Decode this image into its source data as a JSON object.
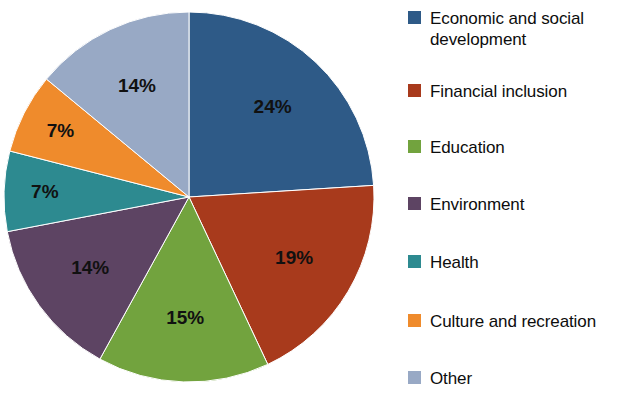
{
  "chart_data": {
    "type": "pie",
    "title": "",
    "subtitle": "",
    "xlabel": "",
    "ylabel": "",
    "legend_position": "right",
    "grid": false,
    "start_angle_deg": 0,
    "direction": "clockwise",
    "categories": [
      "Economic and social development",
      "Financial inclusion",
      "Education",
      "Environment",
      "Health",
      "Culture and recreation",
      "Other"
    ],
    "values": [
      24,
      19,
      15,
      14,
      7,
      7,
      14
    ],
    "data_labels": [
      "24%",
      "19%",
      "15%",
      "14%",
      "7%",
      "7%",
      "14%"
    ],
    "colors": [
      "#2e5a87",
      "#a83a1c",
      "#72a33e",
      "#5d4463",
      "#2d8a90",
      "#ef8b2c",
      "#98a9c5"
    ],
    "slices": [
      {
        "label": "Economic and social development",
        "legend_label": "Economic and social\ndevelopment",
        "value": 24,
        "data_label": "24%",
        "color": "#2e5a87"
      },
      {
        "label": "Financial inclusion",
        "legend_label": "Financial inclusion",
        "value": 19,
        "data_label": "19%",
        "color": "#a83a1c"
      },
      {
        "label": "Education",
        "legend_label": "Education",
        "value": 15,
        "data_label": "15%",
        "color": "#72a33e"
      },
      {
        "label": "Environment",
        "legend_label": "Environment",
        "value": 14,
        "data_label": "14%",
        "color": "#5d4463"
      },
      {
        "label": "Health",
        "legend_label": "Health",
        "value": 7,
        "data_label": "7%",
        "color": "#2d8a90"
      },
      {
        "label": "Culture and recreation",
        "legend_label": "Culture and recreation",
        "value": 7,
        "data_label": "7%",
        "color": "#ef8b2c"
      },
      {
        "label": "Other",
        "legend_label": "Other",
        "value": 14,
        "data_label": "14%",
        "color": "#98a9c5"
      }
    ]
  },
  "legend": {
    "entries": [
      {
        "label": "Economic and social\ndevelopment",
        "color": "#2e5a87",
        "top": 8
      },
      {
        "label": "Financial inclusion",
        "color": "#a83a1c",
        "top": 81
      },
      {
        "label": "Education",
        "color": "#72a33e",
        "top": 137
      },
      {
        "label": "Environment",
        "color": "#5d4463",
        "top": 194
      },
      {
        "label": "Health",
        "color": "#2d8a90",
        "top": 252
      },
      {
        "label": "Culture and recreation",
        "color": "#ef8b2c",
        "top": 311
      },
      {
        "label": "Other",
        "color": "#98a9c5",
        "top": 368
      }
    ]
  },
  "pie_geometry": {
    "center_x": 189,
    "center_y": 197,
    "radius": 185,
    "label_radius_factor": 0.66
  }
}
